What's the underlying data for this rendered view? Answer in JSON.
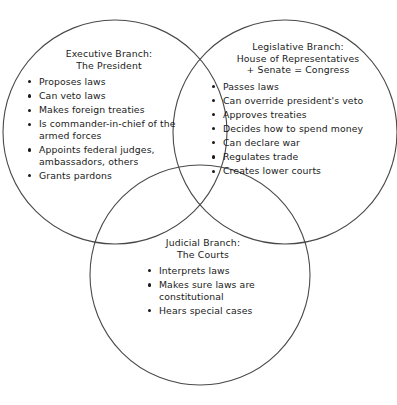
{
  "diagram": {
    "type": "venn-three-circle",
    "background_color": "#ffffff",
    "stroke_color": "#4a4a4a",
    "text_color": "#1a1a1a"
  },
  "circles": [
    {
      "name": "executive-circle",
      "cx": 115,
      "cy": 132,
      "r": 112
    },
    {
      "name": "legislative-circle",
      "cx": 285,
      "cy": 132,
      "r": 112
    },
    {
      "name": "judicial-circle",
      "cx": 200,
      "cy": 275,
      "r": 110
    }
  ],
  "branches": {
    "executive": {
      "heading_line1": "Executive Branch:",
      "heading_line2": "The President",
      "items": [
        "Proposes laws",
        "Can veto laws",
        "Makes foreign treaties",
        "Is commander-in-chief of the armed forces",
        "Appoints federal judges, ambassadors, others",
        "Grants pardons"
      ]
    },
    "legislative": {
      "heading_line1": "Legislative Branch:",
      "heading_line2": "House of Representatives",
      "heading_line3": "+ Senate = Congress",
      "items": [
        "Passes laws",
        "Can override president's veto",
        "Approves treaties",
        "Decides how to spend money",
        "Can declare war",
        "Regulates trade",
        "Creates lower courts"
      ]
    },
    "judicial": {
      "heading_line1": "Judicial Branch:",
      "heading_line2": "The Courts",
      "items": [
        "Interprets laws",
        "Makes sure laws are constitutional",
        "Hears special cases"
      ]
    }
  }
}
